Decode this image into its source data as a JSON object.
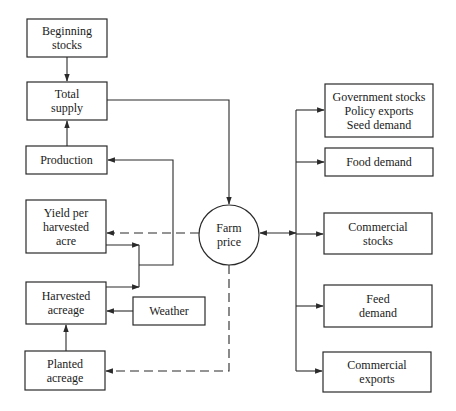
{
  "diagram": {
    "type": "flowchart",
    "nodes": {
      "beginning_stocks": {
        "line1": "Beginning",
        "line2": "stocks"
      },
      "total_supply": {
        "line1": "Total",
        "line2": "supply"
      },
      "production": {
        "line1": "Production"
      },
      "yield": {
        "line1": "Yield per",
        "line2": "harvested",
        "line3": "acre"
      },
      "harvested_acreage": {
        "line1": "Harvested",
        "line2": "acreage"
      },
      "weather": {
        "line1": "Weather"
      },
      "planted_acreage": {
        "line1": "Planted",
        "line2": "acreage"
      },
      "farm_price": {
        "line1": "Farm",
        "line2": "price"
      },
      "government": {
        "line1": "Government stocks",
        "line2": "Policy exports",
        "line3": "Seed demand"
      },
      "food_demand": {
        "line1": "Food demand"
      },
      "commercial_stocks": {
        "line1": "Commercial",
        "line2": "stocks"
      },
      "feed_demand": {
        "line1": "Feed",
        "line2": "demand"
      },
      "commercial_exports": {
        "line1": "Commercial",
        "line2": "exports"
      }
    },
    "edges": [
      {
        "from": "Beginning stocks",
        "to": "Total supply",
        "style": "solid"
      },
      {
        "from": "Production",
        "to": "Total supply",
        "style": "solid"
      },
      {
        "from": "Total supply",
        "to": "Farm price",
        "style": "solid"
      },
      {
        "from": "Farm price",
        "to": "Yield per harvested acre",
        "style": "dashed"
      },
      {
        "from": "Farm price",
        "to": "Planted acreage",
        "style": "dashed"
      },
      {
        "from": "Yield per harvested acre",
        "to": "Production",
        "style": "solid"
      },
      {
        "from": "Harvested acreage",
        "to": "Production",
        "style": "solid"
      },
      {
        "from": "Weather",
        "to": "Harvested acreage",
        "style": "solid"
      },
      {
        "from": "Planted acreage",
        "to": "Harvested acreage",
        "style": "solid"
      },
      {
        "from": "Farm price",
        "to": "Demand bus",
        "style": "solid",
        "bidirectional": true
      },
      {
        "from": "Demand bus",
        "to": "Government stocks / Policy exports / Seed demand",
        "style": "solid"
      },
      {
        "from": "Demand bus",
        "to": "Food demand",
        "style": "solid"
      },
      {
        "from": "Demand bus",
        "to": "Commercial stocks",
        "style": "solid"
      },
      {
        "from": "Demand bus",
        "to": "Feed demand",
        "style": "solid"
      },
      {
        "from": "Demand bus",
        "to": "Commercial exports",
        "style": "solid"
      }
    ]
  }
}
